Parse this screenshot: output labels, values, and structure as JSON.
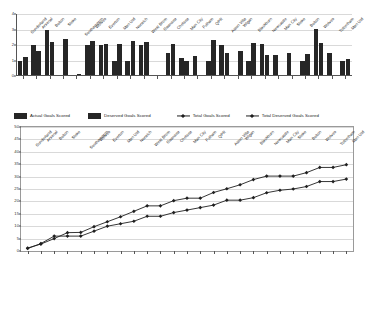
{
  "legend": {
    "items": [
      {
        "label": "Actual Goals Scored",
        "marker": "bar-swatch"
      },
      {
        "label": "Deserved Goals Scored",
        "marker": "bar-swatch"
      },
      {
        "label": "Total Goals Scored",
        "marker": "line-marker"
      },
      {
        "label": "Total Deserved Goals Scored",
        "marker": "line-marker"
      }
    ]
  },
  "colors": {
    "bar": "#262626",
    "line": "#1f1f1f",
    "grid": "#d9d9d9",
    "axis": "#555555",
    "background": "#ffffff"
  },
  "chart_data": [
    {
      "type": "bar",
      "title": "",
      "xlabel": "",
      "ylabel": "",
      "ylim": [
        0,
        4
      ],
      "yticks": [
        0,
        1,
        2,
        3,
        4
      ],
      "grid": true,
      "legend_position": "below",
      "categories": [
        "Sunderland",
        "Arsenal",
        "Bolton",
        "Stoke",
        "Southampton",
        "Wolves",
        "Everton",
        "Man Utd",
        "Norwich",
        "West Brom",
        "Swansea",
        "Chelsea",
        "Man City",
        "Fulham",
        "QPR",
        "Aston Villa",
        "Wigan",
        "Blackburn",
        "Newcastle",
        "Man City",
        "Stoke",
        "Bolton",
        "Wolves",
        "Tottenham",
        "Man Utd"
      ],
      "series": [
        {
          "name": "Actual Goals Scored",
          "values": [
            1,
            2,
            3,
            0,
            0,
            2,
            2,
            1,
            1,
            2,
            0,
            1.5,
            1.15,
            1.3,
            1,
            2,
            0,
            1,
            2.05,
            1.35,
            1.5,
            1,
            3.05,
            1.5,
            1
          ]
        },
        {
          "name": "Deserved Goals Scored",
          "values": [
            1.2,
            1.6,
            2.2,
            2.4,
            0.1,
            2.25,
            2.05,
            2.05,
            2.25,
            2.2,
            0,
            2.05,
            1,
            0,
            2.3,
            1.5,
            1.6,
            2.1,
            1.35,
            0,
            0,
            1.45,
            2.1,
            0,
            1.1
          ]
        }
      ]
    },
    {
      "type": "line",
      "title": "",
      "xlabel": "",
      "ylabel": "",
      "ylim": [
        0,
        50
      ],
      "yticks": [
        0,
        5,
        10,
        15,
        20,
        25,
        30,
        35,
        40,
        45,
        50
      ],
      "grid": true,
      "legend_position": "above",
      "categories": [
        "Sunderland",
        "Arsenal",
        "Bolton",
        "Stoke",
        "Southampton",
        "Wolves",
        "Everton",
        "Man Utd",
        "Norwich",
        "West Brom",
        "Swansea",
        "Chelsea",
        "Man City",
        "Fulham",
        "QPR",
        "Aston Villa",
        "Wigan",
        "Blackburn",
        "Newcastle",
        "Man City",
        "Stoke",
        "Bolton",
        "Wolves",
        "Tottenham",
        "Man Utd"
      ],
      "series": [
        {
          "name": "Total Goals Scored",
          "values": [
            1,
            3,
            6,
            6,
            6,
            8,
            10,
            11,
            12,
            14,
            14,
            15.5,
            16.5,
            17.5,
            18.5,
            20.5,
            20.5,
            21.5,
            23.5,
            24.5,
            25,
            26,
            28,
            28,
            29
          ]
        },
        {
          "name": "Total Deserved Goals Scored",
          "values": [
            1.2,
            2.8,
            5,
            7.4,
            7.5,
            9.8,
            11.8,
            13.8,
            16,
            18.2,
            18.2,
            20.3,
            21.3,
            21.3,
            23.6,
            25.1,
            26.7,
            28.8,
            30.2,
            30.2,
            30.2,
            31.6,
            33.7,
            33.7,
            34.8
          ]
        }
      ]
    }
  ]
}
